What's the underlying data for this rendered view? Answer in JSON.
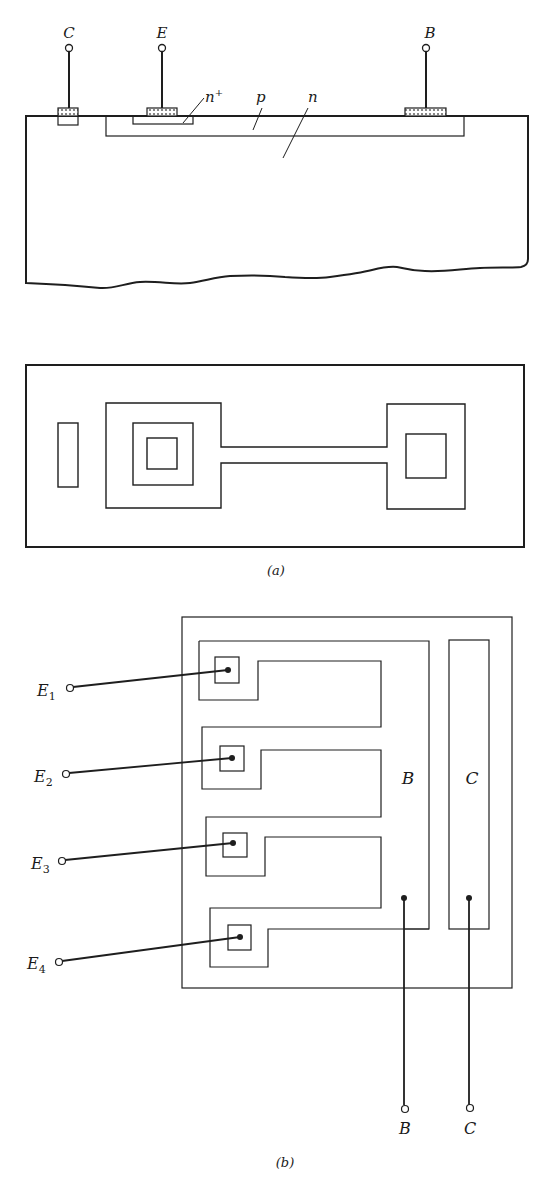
{
  "figure": {
    "part_a": {
      "caption": "(a)",
      "cross_section": {
        "terminals": [
          {
            "label": "C",
            "x": 69,
            "contact": [
              58,
              108,
              20,
              16
            ]
          },
          {
            "label": "E",
            "x": 162,
            "contact": [
              147,
              108,
              30,
              8
            ]
          },
          {
            "label": "B",
            "x": 426,
            "contact": [
              405,
              108,
              41,
              8
            ]
          }
        ],
        "region_labels": [
          {
            "text": "n",
            "sup": "+",
            "x": 203,
            "y": 100
          },
          {
            "text": "p",
            "x": 258,
            "y": 101
          },
          {
            "text": "n",
            "x": 308,
            "y": 101
          }
        ]
      },
      "top_view": {}
    },
    "part_b": {
      "caption": "(b)",
      "emitters": [
        {
          "label": "E",
          "sub": "1",
          "terminal": [
            70,
            688
          ],
          "contact": [
            228,
            670
          ]
        },
        {
          "label": "E",
          "sub": "2",
          "terminal": [
            66,
            774
          ],
          "contact": [
            232,
            758
          ]
        },
        {
          "label": "E",
          "sub": "3",
          "terminal": [
            62,
            861
          ],
          "contact": [
            233,
            843
          ]
        },
        {
          "label": "E",
          "sub": "4",
          "terminal": [
            59,
            962
          ],
          "contact": [
            240,
            937
          ]
        }
      ],
      "base": {
        "region_label": "B",
        "terminal_label": "B"
      },
      "collector": {
        "region_label": "C",
        "terminal_label": "C"
      }
    }
  },
  "colors": {
    "ink": "#1e1e1e",
    "background": "#ffffff",
    "contact_fill": "#d8d8d8"
  }
}
